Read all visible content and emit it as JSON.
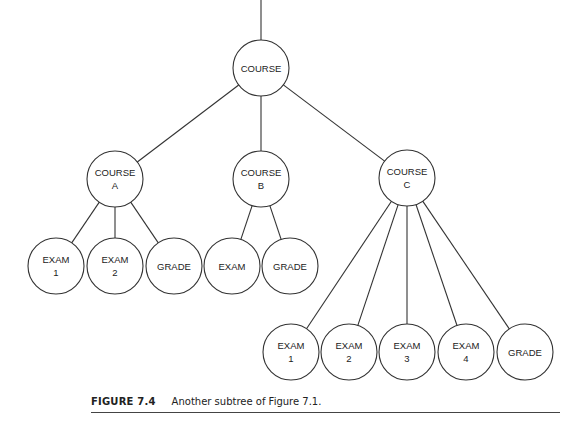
{
  "diagram": {
    "type": "tree",
    "root": "course",
    "nodes": [
      {
        "id": "course",
        "lines": [
          "COURSE"
        ]
      },
      {
        "id": "course-a",
        "lines": [
          "COURSE",
          "A"
        ]
      },
      {
        "id": "course-b",
        "lines": [
          "COURSE",
          "B"
        ]
      },
      {
        "id": "course-c",
        "lines": [
          "COURSE",
          "C"
        ]
      },
      {
        "id": "a-exam-1",
        "lines": [
          "EXAM",
          "1"
        ]
      },
      {
        "id": "a-exam-2",
        "lines": [
          "EXAM",
          "2"
        ]
      },
      {
        "id": "a-grade",
        "lines": [
          "GRADE"
        ]
      },
      {
        "id": "b-exam",
        "lines": [
          "EXAM"
        ]
      },
      {
        "id": "b-grade",
        "lines": [
          "GRADE"
        ]
      },
      {
        "id": "c-exam-1",
        "lines": [
          "EXAM",
          "1"
        ]
      },
      {
        "id": "c-exam-2",
        "lines": [
          "EXAM",
          "2"
        ]
      },
      {
        "id": "c-exam-3",
        "lines": [
          "EXAM",
          "3"
        ]
      },
      {
        "id": "c-exam-4",
        "lines": [
          "EXAM",
          "4"
        ]
      },
      {
        "id": "c-grade",
        "lines": [
          "GRADE"
        ]
      }
    ],
    "edges": [
      [
        "course",
        "course-a"
      ],
      [
        "course",
        "course-b"
      ],
      [
        "course",
        "course-c"
      ],
      [
        "course-a",
        "a-exam-1"
      ],
      [
        "course-a",
        "a-exam-2"
      ],
      [
        "course-a",
        "a-grade"
      ],
      [
        "course-b",
        "b-exam"
      ],
      [
        "course-b",
        "b-grade"
      ],
      [
        "course-c",
        "c-exam-1"
      ],
      [
        "course-c",
        "c-exam-2"
      ],
      [
        "course-c",
        "c-exam-3"
      ],
      [
        "course-c",
        "c-exam-4"
      ],
      [
        "course-c",
        "c-grade"
      ]
    ],
    "root_has_incoming_edge": true
  },
  "caption": {
    "label": "FIGURE 7.4",
    "text": "Another subtree of Figure 7.1."
  }
}
